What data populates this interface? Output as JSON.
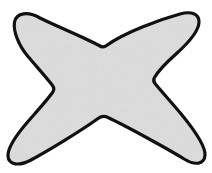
{
  "figure": {
    "shape_name": "x-star-blob",
    "canvas": {
      "width": 212,
      "height": 173,
      "background_color": "#ffffff"
    },
    "style": {
      "fill_color": "#dcdcdc",
      "fill_texture": "subtle paper grain",
      "stroke_color": "#111111",
      "stroke_width": 3.2,
      "line_join": "round"
    },
    "geometry": {
      "arm_count": 4,
      "tips": [
        {
          "name": "top-left-tip",
          "x": 14,
          "y": 17
        },
        {
          "name": "top-right-tip",
          "x": 198,
          "y": 18
        },
        {
          "name": "bottom-right-tip",
          "x": 203,
          "y": 160
        },
        {
          "name": "bottom-left-tip",
          "x": 14,
          "y": 162
        }
      ],
      "notches": [
        {
          "name": "top-notch",
          "x": 103,
          "y": 48
        },
        {
          "name": "right-notch",
          "x": 157,
          "y": 80
        },
        {
          "name": "bottom-notch",
          "x": 100,
          "y": 120
        },
        {
          "name": "left-notch",
          "x": 55,
          "y": 87
        }
      ],
      "center": {
        "x": 104,
        "y": 86
      },
      "path": "M 14.5 22.0 C 16.5 12.5 28.0 11.0 40.0 18.0 C 58.0 27.0 86.0 38.0 99.0 45.5 C 101.5 47.0 104.0 47.5 106.5 45.5 C 124.0 32.5 160.0 19.5 180.0 14.0 C 191.0 11.0 199.5 13.5 199.0 22.5 C 198.5 32.0 186.0 45.0 176.0 54.0 C 167.0 62.0 158.0 71.5 154.5 77.5 C 153.2 79.8 153.4 81.5 155.0 83.5 C 161.0 91.0 173.0 104.0 182.0 115.0 C 193.0 128.5 205.5 145.0 205.0 155.0 C 204.5 164.5 195.0 165.5 185.0 159.5 C 168.0 149.0 126.0 126.0 108.0 117.5 C 104.5 115.8 101.5 116.0 98.0 118.5 C 80.0 131.5 46.0 152.0 31.0 160.0 C 19.0 166.5 8.5 165.0 8.0 156.0 C 7.6 147.5 18.0 133.0 28.0 121.5 C 36.5 111.8 48.0 99.0 52.5 92.5 C 54.3 90.0 54.4 88.0 52.5 85.5 C 47.0 78.0 36.0 66.0 28.0 56.5 C 19.0 46.0 13.0 31.5 14.5 22.0 Z"
    }
  }
}
